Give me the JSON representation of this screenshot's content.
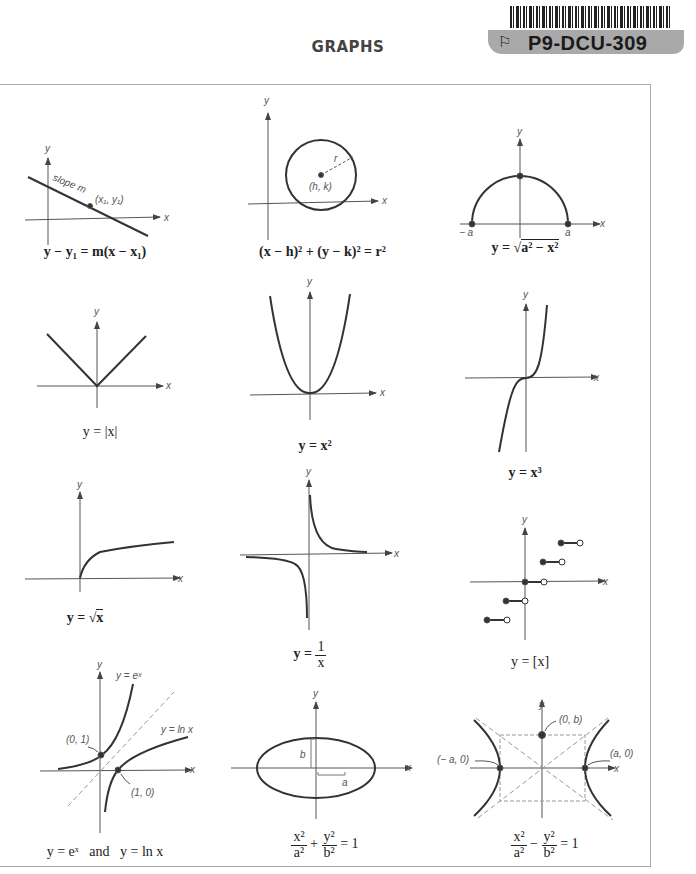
{
  "header": {
    "title": "GRAPHS"
  },
  "sticker": {
    "code": "P9-DCU-309",
    "icon": "flag-outline-icon"
  },
  "graphs": [
    {
      "id": "line",
      "caption": "y − y₁ = m(x − x₁)",
      "labels": {
        "slope": "slope m",
        "point": "(x₁, y₁)",
        "x": "x",
        "y": "y"
      }
    },
    {
      "id": "circle",
      "caption": "(x − h)² + (y − k)² = r²",
      "labels": {
        "center": "(h, k)",
        "radius": "r",
        "x": "x",
        "y": "y"
      }
    },
    {
      "id": "semicircle",
      "caption_prefix": "y = ",
      "caption_radicand": "a² − x²",
      "labels": {
        "neg_a": "− a",
        "a": "a",
        "x": "x",
        "y": "y"
      }
    },
    {
      "id": "abs",
      "caption": "y = |x|",
      "labels": {
        "x": "x",
        "y": "y"
      }
    },
    {
      "id": "square",
      "caption": "y = x²",
      "labels": {
        "x": "x",
        "y": "y"
      }
    },
    {
      "id": "cube",
      "caption": "y = x³",
      "labels": {
        "x": "x",
        "y": "y"
      }
    },
    {
      "id": "sqrt",
      "caption_prefix": "y = ",
      "caption_radicand": "x",
      "labels": {
        "x": "x",
        "y": "y"
      }
    },
    {
      "id": "reciprocal",
      "caption_prefix": "y = ",
      "caption_num": "1",
      "caption_den": "x",
      "labels": {
        "x": "x",
        "y": "y"
      }
    },
    {
      "id": "floor",
      "caption": "y = [x]",
      "labels": {
        "x": "x",
        "y": "y"
      }
    },
    {
      "id": "exp-log",
      "caption": "y = eˣ   and   y = ln x",
      "labels": {
        "exp": "y = eˣ",
        "log": "y = ln x",
        "p01": "(0, 1)",
        "p10": "(1, 0)",
        "x": "x",
        "y": "y"
      }
    },
    {
      "id": "ellipse",
      "caption_num1": "x²",
      "caption_den1": "a²",
      "caption_op": "+",
      "caption_num2": "y²",
      "caption_den2": "b²",
      "caption_rhs": "= 1",
      "labels": {
        "a": "a",
        "b": "b",
        "x": "x",
        "y": "y"
      }
    },
    {
      "id": "hyperbola",
      "caption_num1": "x²",
      "caption_den1": "a²",
      "caption_op": "−",
      "caption_num2": "y²",
      "caption_den2": "b²",
      "caption_rhs": "= 1",
      "labels": {
        "neg_a0": "(− a, 0)",
        "a0": "(a, 0)",
        "b0": "(0, b)",
        "x": "x",
        "y": "y"
      }
    }
  ]
}
